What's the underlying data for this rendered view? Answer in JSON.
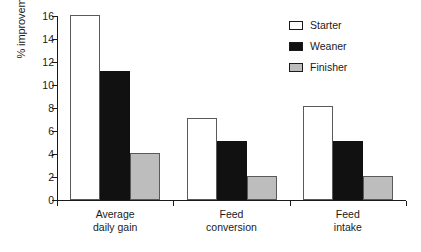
{
  "chart_data": {
    "type": "bar",
    "title": "",
    "subtitle": "",
    "xlabel": "",
    "ylabel": "% improvement",
    "categories": [
      "Average daily gain",
      "Feed conversion",
      "Feed intake"
    ],
    "category_lines": [
      [
        "Average",
        "daily gain"
      ],
      [
        "Feed",
        "conversion"
      ],
      [
        "Feed",
        "intake"
      ]
    ],
    "series": [
      {
        "name": "Starter",
        "values": [
          16.0,
          7.0,
          8.1
        ],
        "color": "#ffffff"
      },
      {
        "name": "Weaner",
        "values": [
          11.1,
          5.0,
          5.0
        ],
        "color": "#111111"
      },
      {
        "name": "Finisher",
        "values": [
          4.0,
          2.0,
          2.0
        ],
        "color": "#bdbdbd"
      }
    ],
    "ylim": [
      0,
      16
    ],
    "yticks": [
      0,
      2,
      4,
      6,
      8,
      10,
      12,
      14,
      16
    ],
    "ytick_labels": [
      "0",
      "2",
      "4",
      "6",
      "8",
      "10",
      "12",
      "14",
      "16"
    ],
    "grid": false,
    "legend_position": "top-right",
    "legend_entries": [
      "Starter",
      "Weaner",
      "Finisher"
    ]
  }
}
